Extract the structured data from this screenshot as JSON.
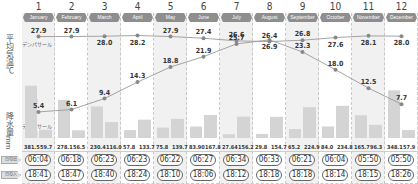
{
  "labels": {
    "temp_axis": "平均気温℃",
    "precip_axis": "降水量mm",
    "sunrise": "日の出",
    "sunset": "日の入",
    "city_denpasar": "デンパサール",
    "city_tokyo": "東京"
  },
  "colors": {
    "tab_bg": "#8e8e8e",
    "shade": "#f1f1f1",
    "line": "#9a9a9a",
    "bar_denpasar": "#d4d4d4",
    "bar_tokyo": "#d4d4d4"
  },
  "months": [
    {
      "num": "1",
      "name": "January"
    },
    {
      "num": "2",
      "name": "February"
    },
    {
      "num": "3",
      "name": "March"
    },
    {
      "num": "4",
      "name": "April"
    },
    {
      "num": "5",
      "name": "May"
    },
    {
      "num": "6",
      "name": "June"
    },
    {
      "num": "7",
      "name": "July"
    },
    {
      "num": "8",
      "name": "August"
    },
    {
      "num": "9",
      "name": "September"
    },
    {
      "num": "10",
      "name": "October"
    },
    {
      "num": "11",
      "name": "November"
    },
    {
      "num": "12",
      "name": "December"
    }
  ],
  "sun": {
    "sunrise": [
      "06:04",
      "06:18",
      "06:23",
      "06:23",
      "06:22",
      "06:27",
      "06:34",
      "06:33",
      "06:21",
      "06:04",
      "05:50",
      "05:50"
    ],
    "sunset": [
      "18:41",
      "18:47",
      "18:40",
      "18:24",
      "18:10",
      "18:06",
      "18:12",
      "18:18",
      "18:18",
      "18:14",
      "18:15",
      "18:26"
    ]
  },
  "chart_data": {
    "type": "line+bar",
    "title": "",
    "categories": [
      "January",
      "February",
      "March",
      "April",
      "May",
      "June",
      "July",
      "August",
      "September",
      "October",
      "November",
      "December"
    ],
    "series": [
      {
        "name": "デンパサール 平均気温℃",
        "type": "line",
        "values": [
          27.9,
          27.9,
          28.0,
          28.2,
          27.9,
          27.4,
          26.6,
          26.4,
          26.8,
          27.6,
          28.1,
          28.0
        ]
      },
      {
        "name": "東京 平均気温℃",
        "type": "line",
        "values": [
          5.4,
          6.1,
          9.4,
          14.3,
          18.8,
          21.9,
          25.7,
          26.9,
          23.3,
          18.0,
          12.5,
          7.7
        ]
      },
      {
        "name": "デンパサール 降水量mm",
        "type": "bar",
        "values": [
          381.5,
          278.1,
          230.4,
          57.8,
          75.8,
          83.9,
          27.64,
          29.8,
          65.2,
          84.0,
          165.7,
          348.1
        ]
      },
      {
        "name": "東京 降水量mm",
        "type": "bar",
        "values": [
          59.7,
          56.5,
          116.0,
          133.7,
          139.7,
          167.8,
          156.2,
          154.7,
          224.9,
          234.8,
          96.3,
          57.9
        ]
      }
    ],
    "precip_labels_denpasar": [
      "381.5",
      "278.1",
      "230.4",
      "57.8",
      "75.8",
      "83.90",
      "27.64",
      "29.8",
      "65.2",
      "84.0",
      "165.7",
      "348.1"
    ],
    "precip_labels_tokyo": [
      "59.7",
      "56.5",
      "116.0",
      "133.7",
      "139.7",
      "167.8",
      "156.2",
      "154.7",
      "224.9",
      "234.8",
      "96.3",
      "57.9"
    ],
    "ylabel": "平均気温℃ / 降水量mm",
    "legend": [
      "デンパサール",
      "東京"
    ],
    "grid": false
  }
}
